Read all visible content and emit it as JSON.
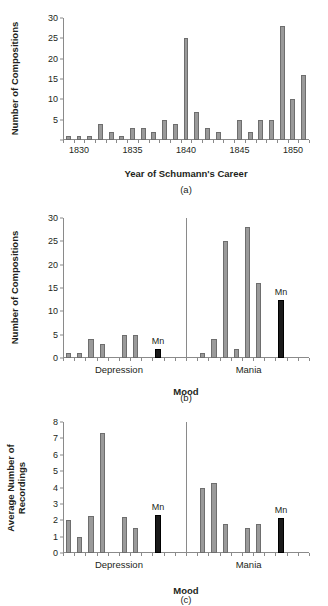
{
  "chart_data": [
    {
      "id": "a",
      "type": "bar",
      "title": "",
      "xlabel": "Year of Schumann's Career",
      "ylabel": "Number of Compositions",
      "caption": "(a)",
      "ylim": [
        0,
        30
      ],
      "yticks": [
        0,
        5,
        10,
        15,
        20,
        25,
        30
      ],
      "ytick_labels": [
        "",
        "5",
        "10",
        "15",
        "20",
        "25",
        "30"
      ],
      "grid": false,
      "legend": "none",
      "xtick_labels": [
        "1830",
        "1835",
        "1840",
        "1845",
        "1850"
      ],
      "xticks": [
        1830,
        1835,
        1840,
        1845,
        1850
      ],
      "xlim": [
        1828.5,
        1851.5
      ],
      "categories": [
        1829,
        1830,
        1831,
        1832,
        1833,
        1834,
        1835,
        1836,
        1837,
        1838,
        1839,
        1840,
        1841,
        1842,
        1843,
        1844,
        1845,
        1846,
        1847,
        1848,
        1849,
        1850,
        1851
      ],
      "values": [
        1,
        1,
        1,
        4,
        2,
        1,
        3,
        3,
        2,
        5,
        4,
        25,
        7,
        3,
        2,
        0,
        5,
        2,
        5,
        5,
        28,
        10,
        16
      ],
      "bar_color": "#9a9a9a"
    },
    {
      "id": "b",
      "type": "bar",
      "title": "",
      "xlabel": "Mood",
      "ylabel": "Number of Compositions",
      "caption": "(b)",
      "ylim": [
        0,
        30
      ],
      "yticks": [
        0,
        5,
        10,
        15,
        20,
        25,
        30
      ],
      "ytick_labels": [
        "0",
        "5",
        "10",
        "15",
        "20",
        "25",
        "30"
      ],
      "grid": false,
      "legend": "none",
      "group_labels": [
        "Depression",
        "Mania"
      ],
      "divider_at_slot": 11,
      "n_slots": 22,
      "bars": [
        {
          "slot": 0,
          "value": 1,
          "color": "grey"
        },
        {
          "slot": 1,
          "value": 1,
          "color": "grey"
        },
        {
          "slot": 2,
          "value": 4,
          "color": "grey"
        },
        {
          "slot": 3,
          "value": 3,
          "color": "grey"
        },
        {
          "slot": 5,
          "value": 5,
          "color": "grey"
        },
        {
          "slot": 6,
          "value": 5,
          "color": "grey"
        },
        {
          "slot": 8,
          "value": 2,
          "color": "black",
          "label": "Mn"
        },
        {
          "slot": 12,
          "value": 1,
          "color": "grey"
        },
        {
          "slot": 13,
          "value": 4,
          "color": "grey"
        },
        {
          "slot": 14,
          "value": 25,
          "color": "grey"
        },
        {
          "slot": 15,
          "value": 2,
          "color": "grey"
        },
        {
          "slot": 16,
          "value": 28,
          "color": "grey"
        },
        {
          "slot": 17,
          "value": 16,
          "color": "grey"
        },
        {
          "slot": 19,
          "value": 12.5,
          "color": "black",
          "label": "Mn"
        }
      ],
      "bar_color": "#9a9a9a",
      "highlight_color": "#1a1a1a"
    },
    {
      "id": "c",
      "type": "bar",
      "title": "",
      "xlabel": "Mood",
      "ylabel": "Average Number of\nRecordings",
      "caption": "(c)",
      "ylim": [
        0,
        8
      ],
      "yticks": [
        0,
        1,
        2,
        3,
        4,
        5,
        6,
        7,
        8
      ],
      "ytick_labels": [
        "0",
        "1",
        "2",
        "3",
        "4",
        "5",
        "6",
        "7",
        "8"
      ],
      "grid": false,
      "legend": "none",
      "group_labels": [
        "Depression",
        "Mania"
      ],
      "divider_at_slot": 11,
      "n_slots": 22,
      "bars": [
        {
          "slot": 0,
          "value": 2.0,
          "color": "grey"
        },
        {
          "slot": 1,
          "value": 1.0,
          "color": "grey"
        },
        {
          "slot": 2,
          "value": 2.25,
          "color": "grey"
        },
        {
          "slot": 3,
          "value": 7.3,
          "color": "grey"
        },
        {
          "slot": 5,
          "value": 2.2,
          "color": "grey"
        },
        {
          "slot": 6,
          "value": 1.55,
          "color": "grey"
        },
        {
          "slot": 8,
          "value": 2.3,
          "color": "black",
          "label": "Mn"
        },
        {
          "slot": 12,
          "value": 4.0,
          "color": "grey"
        },
        {
          "slot": 13,
          "value": 4.3,
          "color": "grey"
        },
        {
          "slot": 14,
          "value": 1.75,
          "color": "grey"
        },
        {
          "slot": 16,
          "value": 1.55,
          "color": "grey"
        },
        {
          "slot": 17,
          "value": 1.75,
          "color": "grey"
        },
        {
          "slot": 19,
          "value": 2.15,
          "color": "black",
          "label": "Mn"
        }
      ],
      "bar_color": "#9a9a9a",
      "highlight_color": "#1a1a1a"
    }
  ],
  "figure": {
    "background": "#ffffff",
    "axis_color": "#8a8a8a",
    "text_color": "#231f20"
  }
}
